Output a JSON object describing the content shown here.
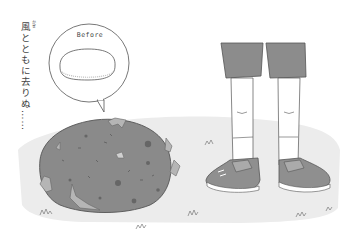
{
  "illustration": {
    "caption_vertical": "風とともに去りぬ……",
    "caption_furigana": "かぜ",
    "bubble": {
      "label": "Before"
    },
    "colors": {
      "background": "#ffffff",
      "ground_shadow": "#ebebeb",
      "blob_fill": "#8a8a8a",
      "blob_outline": "#555555",
      "blob_flake": "#b5b5b5",
      "blob_spots": "#6a6a6a",
      "shorts": "#8c8c8c",
      "socks": "#ffffff",
      "shoe": "#8f8f8f",
      "shoe_sole": "#ffffff",
      "line": "#555555"
    }
  }
}
